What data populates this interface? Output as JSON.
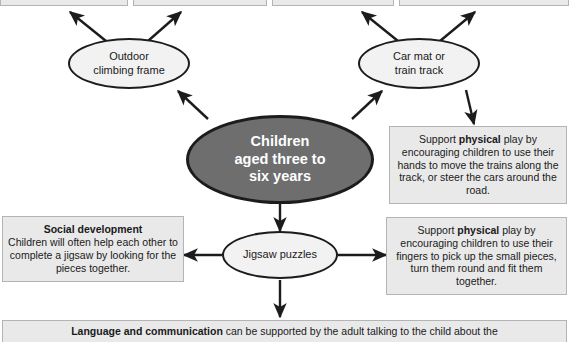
{
  "diagram": {
    "colors": {
      "box_fill": "#e9e9e9",
      "box_border": "#b4b4b4",
      "ellipse_fill": "#f2f2f2",
      "ellipse_border": "#1c1c1c",
      "center_fill": "#6e6e6e",
      "center_text": "#ffffff",
      "arrow": "#1c1c1c",
      "page_background": "#ffffff"
    },
    "center_node": {
      "label_line1": "Children",
      "label_line2": "aged three to",
      "label_line3": "six years"
    },
    "activity_nodes": [
      {
        "id": "outdoor-climbing-frame",
        "label_line1": "Outdoor",
        "label_line2": "climbing frame"
      },
      {
        "id": "car-mat-train-track",
        "label_line1": "Car mat or",
        "label_line2": "train track"
      },
      {
        "id": "jigsaw-puzzles",
        "label_line1": "Jigsaw puzzles",
        "label_line2": ""
      }
    ],
    "top_boxes": [
      {
        "id": "top-box-1",
        "text": ""
      },
      {
        "id": "top-box-2",
        "text": ""
      },
      {
        "id": "top-box-3",
        "text": ""
      },
      {
        "id": "top-box-4",
        "text": ""
      }
    ],
    "description_boxes": [
      {
        "id": "physical-play-trains",
        "lead": "Support ",
        "strong": "physical",
        "rest": " play by encouraging children to use their hands to move the trains along the track, or steer the cars around the road."
      },
      {
        "id": "physical-play-pieces",
        "lead": "Support ",
        "strong": "physical",
        "rest": " play by encouraging children to use their fingers to pick up the small pieces, turn them round and fit them together."
      },
      {
        "id": "social-development",
        "heading": "Social development",
        "body": "Children will often help each other to complete a jigsaw by looking for the pieces together."
      }
    ],
    "bottom_bar": {
      "strong": "Language and communication",
      "rest": " can be supported by the adult talking to the child about the"
    }
  }
}
